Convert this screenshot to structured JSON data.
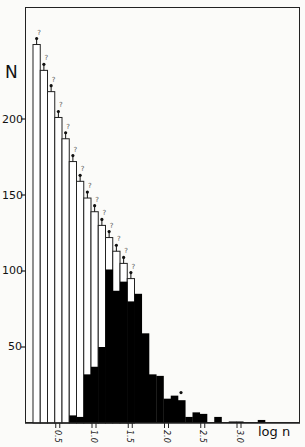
{
  "chart_data": {
    "type": "bar",
    "subtype": "overlaid histogram",
    "title": "",
    "xlabel": "log n",
    "ylabel": "N",
    "ylim": [
      0,
      260
    ],
    "xlim": [
      0.05,
      3.8
    ],
    "bin_width": 0.1,
    "y_ticks": [
      50,
      100,
      150,
      200
    ],
    "x_ticks": [
      "0.5",
      "1.0",
      "1.5",
      "2.0",
      "2.5",
      "3.0"
    ],
    "grid": false,
    "bin_start": 0.15,
    "series": [
      {
        "name": "open (upper limits, marked with arrow and ?)",
        "fill": "#ffffff",
        "values": [
          249,
          232,
          218,
          201,
          187,
          172,
          159,
          148,
          139,
          130,
          122,
          113,
          105,
          95
        ]
      },
      {
        "name": "filled",
        "fill": "#000000",
        "values": [
          0,
          0,
          0,
          0,
          0,
          5,
          4,
          32,
          37,
          50,
          101,
          87,
          93,
          80,
          85,
          59,
          32,
          31,
          16,
          18,
          15,
          4,
          7,
          6,
          0,
          4,
          0,
          1,
          1,
          0,
          0,
          2,
          0,
          0,
          0,
          0
        ]
      }
    ],
    "annotations": [
      "? above each open bar with upward arrow",
      "dot marker above filled bar near log n 2.2"
    ]
  },
  "axes": {
    "y_title": "N",
    "x_title": "log n",
    "y_tick_labels": [
      "50",
      "100",
      "150",
      "200"
    ],
    "x_tick_labels": [
      "0.5",
      "1.0",
      "1.5",
      "2.0",
      "2.5",
      "3.0"
    ]
  }
}
